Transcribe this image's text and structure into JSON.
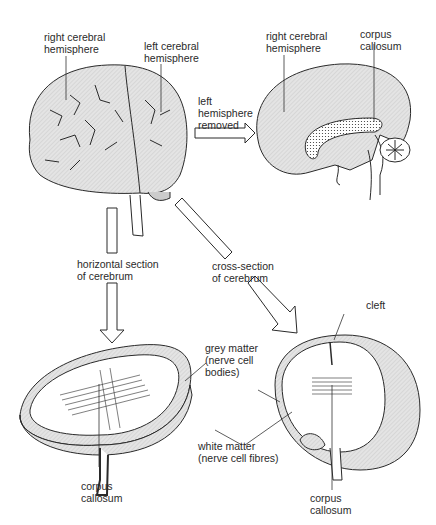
{
  "labels": {
    "top_left_right_hemisphere": "right cerebral\nhemisphere",
    "top_left_left_hemisphere": "left cerebral\nhemisphere",
    "arrow_left_removed": "left\nhemisphere\nremoved",
    "top_right_right_hemisphere": "right cerebral\nhemisphere",
    "top_right_corpus_callosum": "corpus\ncallosum",
    "arrow_horizontal_section": "horizontal section\nof cerebrum",
    "arrow_cross_section": "cross-section\nof cerebrum",
    "cleft": "cleft",
    "grey_matter": "grey matter\n(nerve cell\nbodies)",
    "white_matter": "white matter\n(nerve cell fibres)",
    "bottom_left_corpus_callosum": "corpus\ncallosum",
    "bottom_right_corpus_callosum": "corpus\ncallosum"
  },
  "colors": {
    "ink": "#2a2a2a",
    "fill": "#e6e6e6",
    "background": "#ffffff"
  }
}
